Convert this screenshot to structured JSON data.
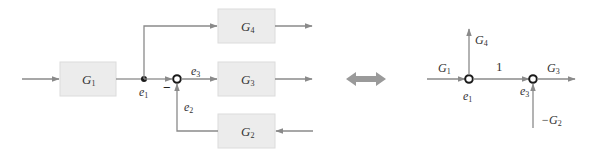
{
  "block_diagram": {
    "blocks": [
      {
        "id": "G1",
        "label": "G",
        "sub": "1"
      },
      {
        "id": "G4",
        "label": "G",
        "sub": "4"
      },
      {
        "id": "G3",
        "label": "G",
        "sub": "3"
      },
      {
        "id": "G2",
        "label": "G",
        "sub": "2"
      }
    ],
    "signals": {
      "e1": {
        "label": "e",
        "sub": "1"
      },
      "e2": {
        "label": "e",
        "sub": "2"
      },
      "e3": {
        "label": "e",
        "sub": "3"
      }
    },
    "summing_sign": "−"
  },
  "equivalence_arrow": "double-arrow",
  "signal_flow_graph": {
    "branches": {
      "G1": {
        "label": "G",
        "sub": "1"
      },
      "G4": {
        "label": "G",
        "sub": "4"
      },
      "one": {
        "label": "1"
      },
      "G3": {
        "label": "G",
        "sub": "3"
      },
      "minusG2": {
        "label": "−G",
        "sub": "2"
      }
    },
    "nodes": {
      "e1": {
        "label": "e",
        "sub": "1"
      },
      "e3": {
        "label": "e",
        "sub": "3"
      }
    }
  },
  "colors": {
    "line": "#8a8a8a",
    "box_fill": "#ececec",
    "arrow": "#9a9a9a",
    "node": "#1a1a1a"
  }
}
